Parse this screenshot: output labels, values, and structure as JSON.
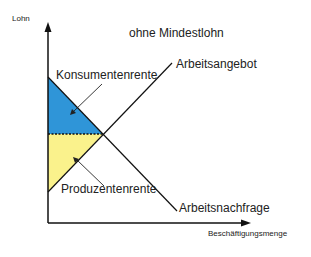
{
  "title": "ohne Mindestlohn",
  "axes": {
    "y_label": "Lohn",
    "x_label": "Beschäftigungsmenge"
  },
  "curves": {
    "supply_label": "Arbeitsangebot",
    "demand_label": "Arbeitsnachfrage"
  },
  "areas": {
    "consumer_surplus_label": "Konsumentenrente",
    "producer_surplus_label": "Produzentenrente"
  },
  "colors": {
    "consumer_surplus": "#2f95d8",
    "producer_surplus": "#faf28c",
    "lines": "#111111"
  }
}
